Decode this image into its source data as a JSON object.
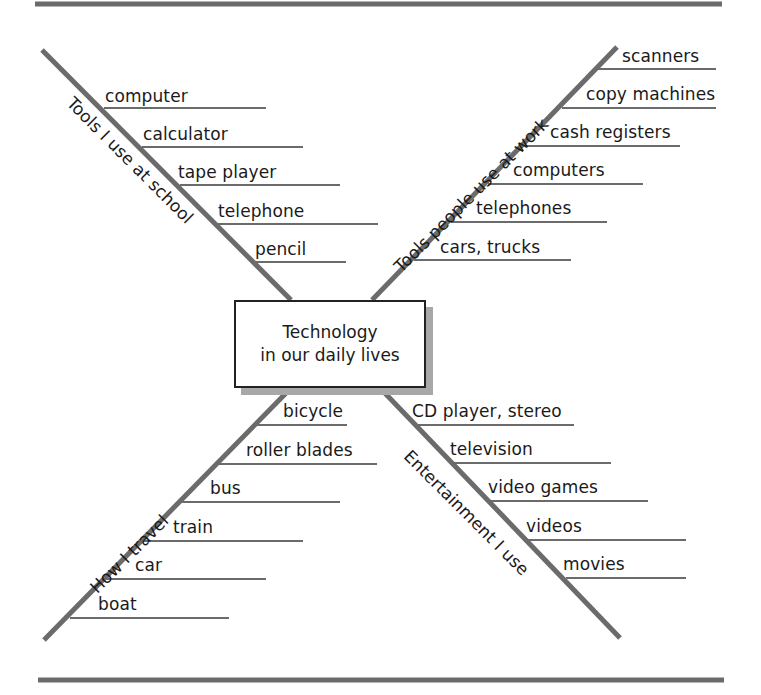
{
  "diagram": {
    "type": "concept-web",
    "center": {
      "line1": "Technology",
      "line2": "in our daily lives"
    },
    "colors": {
      "lines": "#6b6b6b",
      "text": "#1a1a1a",
      "shadow": "#a8a8a8"
    },
    "branches": [
      {
        "position": "top-left",
        "category": "Tools I use at school",
        "items": [
          "computer",
          "calculator",
          "tape player",
          "telephone",
          "pencil"
        ]
      },
      {
        "position": "top-right",
        "category": "Tools people use at work",
        "items": [
          "scanners",
          "copy machines",
          "cash registers",
          "computers",
          "telephones",
          "cars, trucks"
        ]
      },
      {
        "position": "bottom-left",
        "category": "How I travel",
        "items": [
          "bicycle",
          "roller blades",
          "bus",
          "train",
          "car",
          "boat"
        ]
      },
      {
        "position": "bottom-right",
        "category": "Entertainment I use",
        "items": [
          "CD player, stereo",
          "television",
          "video games",
          "videos",
          "movies"
        ]
      }
    ]
  }
}
